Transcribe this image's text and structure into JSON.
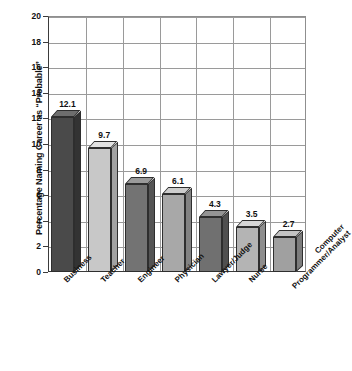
{
  "chart_data": {
    "type": "bar",
    "title": "",
    "xlabel": "",
    "ylabel": "Percentage Naming Career as “Probable”",
    "categories": [
      "Business",
      "Teacher",
      "Engineer",
      "Physician",
      "Lawyer/Judge",
      "Nurse",
      "Computer\nProgrammer/Analyst"
    ],
    "values": [
      12.1,
      9.7,
      6.9,
      6.1,
      4.3,
      3.5,
      2.7
    ],
    "value_labels": [
      "12.1",
      "9.7",
      "6.9",
      "6.1",
      "4.3",
      "3.5",
      "2.7"
    ],
    "ylim": [
      0,
      20
    ],
    "ytick_step": 2,
    "yticks": [
      "20",
      "18",
      "16",
      "14",
      "12",
      "10",
      "8",
      "6",
      "4",
      "2",
      "0"
    ],
    "grid": true,
    "legend": null,
    "bar_style": "3d-extruded",
    "bar_colors": [
      "#4a4a4a",
      "#c8c8c8",
      "#737373",
      "#a8a8a8",
      "#707070",
      "#b4b4b4",
      "#a0a0a0"
    ],
    "bar_top_colors": [
      "#6e6e6e",
      "#e2e2e2",
      "#9a9a9a",
      "#cdcdcd",
      "#949494",
      "#d6d6d6",
      "#c4c4c4"
    ],
    "bar_side_colors": [
      "#333333",
      "#a2a2a2",
      "#545454",
      "#828282",
      "#505050",
      "#8e8e8e",
      "#7c7c7c"
    ],
    "outline_color": "#2e2e2e",
    "grid_color": "#9a9a9a",
    "axis_color": "#3b3b3b",
    "background": "#ffffff"
  }
}
